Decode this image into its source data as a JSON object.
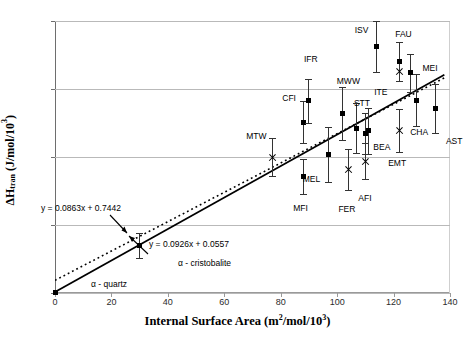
{
  "chart_data": {
    "type": "scatter",
    "title": "",
    "xlabel": "Internal Surface Area (m2/mol/103)",
    "ylabel": "ΔHtran (J/mol/103)",
    "xlim": [
      0,
      140
    ],
    "ylim": [
      0,
      16
    ],
    "xticks": [
      0,
      20,
      40,
      60,
      80,
      100,
      120,
      140
    ],
    "yticks": [
      0,
      4,
      8,
      12,
      16
    ],
    "grid": "horizontal",
    "legend": "none",
    "series": [
      {
        "name": "square-markers",
        "marker": "filled-square",
        "points": [
          {
            "label": "α - quartz",
            "x": 0,
            "y": 0.05,
            "err": 0.0
          },
          {
            "label": "α - cristobalite",
            "x": 30,
            "y": 2.8,
            "err": 0.75
          },
          {
            "label": "CFI",
            "x": 88,
            "y": 10.05,
            "err": 1.25
          },
          {
            "label": "IFR",
            "x": 90,
            "y": 11.3,
            "err": 1.3
          },
          {
            "label": "MFI",
            "x": 88,
            "y": 6.85,
            "err": 1.05
          },
          {
            "label": "MEL",
            "x": 97,
            "y": 8.15,
            "err": 1.6
          },
          {
            "label": "MWW",
            "x": 102,
            "y": 10.55,
            "err": 1.55
          },
          {
            "label": "STT",
            "x": 107,
            "y": 9.7,
            "err": 1.45
          },
          {
            "label": "BEA",
            "x": 110,
            "y": 9.4,
            "err": 1.2
          },
          {
            "label": "ITE",
            "x": 111,
            "y": 9.55,
            "err": 1.35
          },
          {
            "label": "ISV",
            "x": 114,
            "y": 14.5,
            "err": 1.5
          },
          {
            "label": "FAU",
            "x": 122,
            "y": 13.6,
            "err": 1.15
          },
          {
            "label": "MEI",
            "x": 126,
            "y": 12.95,
            "err": 1.1
          },
          {
            "label": "CHA",
            "x": 128,
            "y": 11.35,
            "err": 1.55
          },
          {
            "label": "AST",
            "x": 135,
            "y": 10.85,
            "err": 1.45
          }
        ]
      },
      {
        "name": "cross-markers",
        "marker": "x-cross",
        "points": [
          {
            "label": "MTW",
            "x": 77,
            "y": 8.0,
            "err": 1.1
          },
          {
            "label": "FER",
            "x": 104,
            "y": 7.25,
            "err": 1.2
          },
          {
            "label": "AFI",
            "x": 110,
            "y": 7.75,
            "err": 1.05
          },
          {
            "label": "FAU",
            "x": 122,
            "y": 13.05,
            "err": 0.0
          },
          {
            "label": "EMT",
            "x": 122,
            "y": 9.55,
            "err": 1.25
          }
        ]
      }
    ],
    "fit_lines": [
      {
        "name": "dotted-fit",
        "equation": "y = 0.0863x + 0.7442",
        "slope": 0.0863,
        "intercept": 0.7442,
        "style": "dotted"
      },
      {
        "name": "solid-fit",
        "equation": "y = 0.0926x + 0.0557",
        "slope": 0.0926,
        "intercept": 0.0557,
        "style": "solid"
      }
    ],
    "annotations": [
      {
        "name": "phase-cristobalite",
        "text": "α - cristobalite"
      },
      {
        "name": "phase-quartz",
        "text": "α - quartz"
      }
    ]
  },
  "axes": {
    "y_title_parts": {
      "delta_h": "ΔH",
      "sub": "tran",
      "unit_open": " (J/mol/10",
      "sup": "3",
      "unit_close": ")"
    },
    "x_title_parts": {
      "main": "Internal Surface Area (m",
      "sup1": "2",
      "mid": "/mol/10",
      "sup2": "3",
      "close": ")"
    },
    "yticks": [
      "16",
      "12",
      "8",
      "4",
      "0"
    ],
    "xticks": [
      "0",
      "20",
      "40",
      "60",
      "80",
      "100",
      "120",
      "140"
    ]
  },
  "equations": {
    "dotted": "y = 0.0863x + 0.7442",
    "solid": "y = 0.0926x + 0.0557"
  },
  "phases": {
    "cristobalite": "α - cristobalite",
    "quartz": "α - quartz"
  },
  "colors": {
    "marker": "#000000",
    "grid": "#b9b9b9",
    "axis": "#6e6e6e",
    "text": "#000000"
  }
}
